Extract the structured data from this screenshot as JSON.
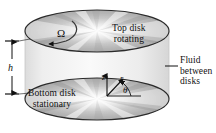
{
  "figure": {
    "type": "technical-diagram",
    "background_color": "#ffffff",
    "ink_color": "#111111",
    "labels": {
      "top_disk_line1": "Top disk",
      "top_disk_line2": "rotating",
      "bottom_disk_line1": "Bottom disk",
      "bottom_disk_line2": "stationary",
      "fluid_line1": "Fluid",
      "fluid_line2": "between",
      "fluid_line3": "disks",
      "gap_height": "h",
      "angular_velocity": "Ω",
      "axis_z": "z",
      "axis_r": "r",
      "axis_theta": "θ"
    },
    "geometry": {
      "top_disk_center_x": 97,
      "top_disk_center_y": 31,
      "top_disk_radius_x": 72,
      "top_disk_radius_y": 21,
      "bottom_disk_center_x": 97,
      "bottom_disk_center_y": 99,
      "bottom_disk_radius_x": 72,
      "bottom_disk_radius_y": 21,
      "gap": 68
    },
    "colors": {
      "disk_light": "#fbfbfb",
      "disk_mid": "#b9b9b9",
      "disk_dark": "#8e8e8e",
      "disk_edge": "#2b2b2b",
      "fluid_fill": "#efefef",
      "fluid_edge": "#cfcfcf"
    }
  }
}
